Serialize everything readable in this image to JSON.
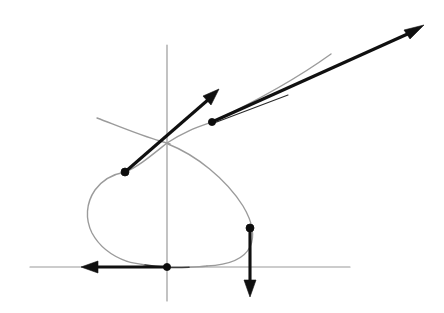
{
  "figure": {
    "width": 444,
    "height": 313,
    "background_color": "#ffffff"
  },
  "colors": {
    "axis": "#9a9a9a",
    "curve": "#3c3c3c",
    "curve_faint": "#9b9b9b",
    "vector": "#101010",
    "point": "#0d0d0d",
    "background": "#ffffff"
  },
  "axes": {
    "origin": {
      "x": 167,
      "y": 267
    },
    "x_axis": {
      "name": "horizontal-axis",
      "x1": 30,
      "y1": 267,
      "x2": 350,
      "y2": 267
    },
    "y_axis": {
      "name": "vertical-axis",
      "x1": 167,
      "y1": 45,
      "x2": 167,
      "y2": 301
    }
  },
  "curve": {
    "name": "looped-curve",
    "type": "self-intersecting loop with two tails",
    "self_intersection": {
      "x": 167,
      "y": 143
    },
    "leftmost": {
      "x": 88,
      "y": 216
    },
    "bottom_tangent_to_x_axis": {
      "x": 167,
      "y": 267
    },
    "path_main": "M 97 118 C 125 128, 150 138, 167 143 C 200 153, 232 180, 248 212 C 261 238, 243 262, 206 267 C 180 270, 152 270, 130 264 C 100 255, 84 238, 88 214 C 92 190, 110 172, 132 162 C 155 151, 185 139, 212 122 C 250 98, 300 70, 330 53",
    "path_loop_lower_left": "M 88 214 C 91 238, 108 256, 134 264",
    "gap_segments": [
      {
        "name": "curve-gap-left",
        "x": 126,
        "y": 262
      },
      {
        "name": "curve-gap-right",
        "x": 215,
        "y": 265
      }
    ]
  },
  "points": [
    {
      "name": "point-on-upper-left-branch",
      "label": "P1",
      "x": 125,
      "y": 172,
      "radius": 4.0
    },
    {
      "name": "point-on-upper-right-branch",
      "label": "P2",
      "x": 212,
      "y": 122,
      "radius": 3.6
    },
    {
      "name": "point-on-right-loop",
      "label": "P3",
      "x": 250,
      "y": 228,
      "radius": 4.0
    },
    {
      "name": "point-at-origin",
      "label": "P4",
      "x": 167,
      "y": 267,
      "radius": 3.6
    }
  ],
  "vectors": [
    {
      "name": "tangent-vector-upper-short",
      "from": {
        "x": 125,
        "y": 172
      },
      "to": {
        "x": 218,
        "y": 90
      },
      "direction": "up-right",
      "style": "thick",
      "head_length": 17,
      "head_width": 11
    },
    {
      "name": "tangent-vector-upper-long",
      "from": {
        "x": 212,
        "y": 122
      },
      "to": {
        "x": 424,
        "y": 25
      },
      "direction": "up-right",
      "style": "thick",
      "head_length": 19,
      "head_width": 12
    },
    {
      "name": "tangent-vector-down",
      "from": {
        "x": 250,
        "y": 228
      },
      "to": {
        "x": 250,
        "y": 296
      },
      "direction": "down",
      "style": "thick",
      "head_length": 17,
      "head_width": 11
    },
    {
      "name": "tangent-vector-left",
      "from": {
        "x": 167,
        "y": 267
      },
      "to": {
        "x": 82,
        "y": 267
      },
      "direction": "left",
      "style": "thick",
      "head_length": 17,
      "head_width": 11
    }
  ],
  "tangent_hints": [
    {
      "name": "tangent-hint-line",
      "x1": 214,
      "y1": 123,
      "x2": 288,
      "y2": 95
    }
  ]
}
